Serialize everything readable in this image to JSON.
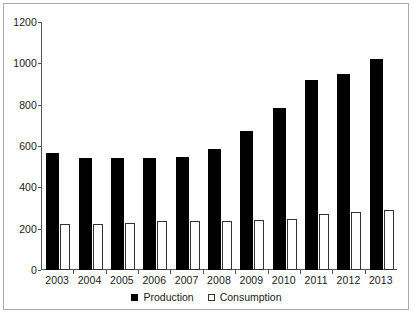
{
  "chart_data": {
    "type": "bar",
    "title": "",
    "subtitle": "",
    "xlabel": "",
    "ylabel": "",
    "categories": [
      "2003",
      "2004",
      "2005",
      "2006",
      "2007",
      "2008",
      "2009",
      "2010",
      "2011",
      "2012",
      "2013"
    ],
    "series": [
      {
        "name": "Production",
        "color": "#000000",
        "style": "filled",
        "values": [
          565,
          540,
          540,
          540,
          548,
          585,
          675,
          782,
          920,
          948,
          1022
        ]
      },
      {
        "name": "Consumption",
        "color": "#ffffff",
        "style": "outlined",
        "values": [
          225,
          225,
          228,
          238,
          238,
          238,
          242,
          248,
          270,
          282,
          292
        ]
      }
    ],
    "ylim": [
      0,
      1200
    ],
    "yticks": [
      0,
      200,
      400,
      600,
      800,
      1000,
      1200
    ],
    "ytick_labels": [
      "0",
      "200",
      "400",
      "600",
      "800",
      "1000",
      "1200"
    ],
    "grid": false,
    "legend_position": "bottom-center"
  },
  "legend": {
    "items": [
      {
        "label": "Production",
        "swatch": "filled-square-icon"
      },
      {
        "label": "Consumption",
        "swatch": "open-square-icon"
      }
    ]
  },
  "colors": {
    "frame": "#a9a9a9",
    "axis": "#555555",
    "background": "#ffffff",
    "text": "#1a1a1a",
    "production": "#000000",
    "consumption": "#ffffff"
  }
}
